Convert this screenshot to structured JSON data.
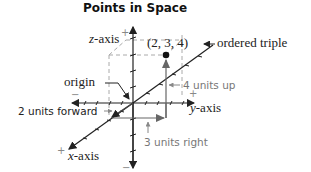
{
  "title": "Points in Space",
  "labels": {
    "z_axis": "z",
    "z_axis_suffix": "-axis",
    "y_axis": "y",
    "y_axis_suffix": "-axis",
    "x_axis": "x",
    "x_axis_suffix": "-axis",
    "ordered_triple_value": "(2, 3, 4)",
    "ordered_triple": "ordered triple",
    "origin": "origin",
    "forward": "2 units forward",
    "right": "3 units right",
    "up": "4 units up",
    "plus": "+",
    "minus": "−"
  },
  "point": {
    "x": 2,
    "y": 3,
    "z": 4
  },
  "colors": {
    "axis": "#222222",
    "dashed": "#aaaaaa",
    "arrow_gray": "#777777",
    "path": "#666666"
  }
}
